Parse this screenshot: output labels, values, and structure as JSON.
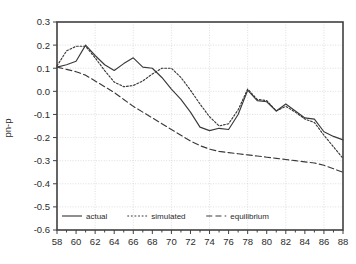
{
  "chart_data": {
    "type": "line",
    "title": "",
    "subtitle": "",
    "xlabel": "",
    "ylabel": "pn-p",
    "xlim": [
      58,
      88
    ],
    "ylim": [
      -0.6,
      0.3
    ],
    "grid": true,
    "legend_position": "bottom-left-inside",
    "xticks": [
      58,
      60,
      62,
      64,
      66,
      68,
      70,
      72,
      74,
      76,
      78,
      80,
      82,
      84,
      86,
      88
    ],
    "xtick_labels": [
      "58",
      "60",
      "62",
      "64",
      "66",
      "68",
      "70",
      "72",
      "74",
      "76",
      "78",
      "80",
      "82",
      "84",
      "86",
      "88"
    ],
    "yticks": [
      0.3,
      0.2,
      0.1,
      0.0,
      -0.1,
      -0.2,
      -0.3,
      -0.4,
      -0.5,
      -0.6
    ],
    "ytick_labels": [
      "0.3",
      "0.2",
      "0.1",
      "0.0",
      "-0.1",
      "-0.2",
      "-0.3",
      "-0.4",
      "-0.5",
      "-0.6"
    ],
    "x": [
      58,
      59,
      60,
      61,
      62,
      63,
      64,
      65,
      66,
      67,
      68,
      69,
      70,
      71,
      72,
      73,
      74,
      75,
      76,
      77,
      78,
      79,
      80,
      81,
      82,
      83,
      84,
      85,
      86,
      87,
      88
    ],
    "series": [
      {
        "name": "actual",
        "style": "solid",
        "color": "#3a3a3a",
        "values": [
          0.105,
          0.115,
          0.13,
          0.2,
          0.155,
          0.115,
          0.09,
          0.12,
          0.145,
          0.105,
          0.1,
          0.06,
          0.01,
          -0.035,
          -0.09,
          -0.155,
          -0.17,
          -0.16,
          -0.165,
          -0.1,
          0.005,
          -0.04,
          -0.045,
          -0.085,
          -0.055,
          -0.085,
          -0.115,
          -0.12,
          -0.175,
          -0.195,
          -0.21
        ]
      },
      {
        "name": "simulated",
        "style": "dotted",
        "color": "#3a3a3a",
        "values": [
          0.11,
          0.175,
          0.195,
          0.195,
          0.145,
          0.09,
          0.04,
          0.02,
          0.025,
          0.045,
          0.075,
          0.1,
          0.1,
          0.06,
          0.005,
          -0.055,
          -0.11,
          -0.15,
          -0.14,
          -0.08,
          0.01,
          -0.035,
          -0.04,
          -0.085,
          -0.065,
          -0.09,
          -0.12,
          -0.135,
          -0.19,
          -0.24,
          -0.29
        ]
      },
      {
        "name": "equilibrium",
        "style": "dashed",
        "color": "#3a3a3a",
        "values": [
          0.105,
          0.095,
          0.085,
          0.07,
          0.045,
          0.02,
          -0.005,
          -0.035,
          -0.065,
          -0.09,
          -0.115,
          -0.14,
          -0.165,
          -0.19,
          -0.215,
          -0.235,
          -0.25,
          -0.26,
          -0.265,
          -0.27,
          -0.275,
          -0.28,
          -0.285,
          -0.29,
          -0.295,
          -0.3,
          -0.305,
          -0.31,
          -0.32,
          -0.335,
          -0.35
        ]
      }
    ],
    "plot_series_pixel_paths": {
      "actual": "M 57,83 L 66.5,80 L 76,73 L 85.5,44 L 95,63 L 104.5,82 L 114,92 L 123.5,77 L 133,65 L 142.5,84 L 152,86 L 161.5,104 L 171,129 L 180.5,151 L 190,178 L 199.5,183 L 209,41 L 218.5,114 L 228,151 L 237.5,151 L 247,41 L 256.5,123 L 266,76 L 275.5,106 L 285,95 L 294.5,115 L 304,91 L 313.5,110 L 323,172 L 332.5,213 L 342,225",
      "simulated": "M 57,81 L 66.5,49 L 76,41 L 85.5,41 L 95,66 L 104.5,92 L 114,116 L 123.5,126 L 133,124 L 142.5,114 L 152,99 L 161.5,87 L 171,87 L 180.5,107 L 190,134 L 199.5,164 L 209,55 L 218.5,70 L 228,36 L 237.5,44 L 247,64 L 256.5,89 L 266,79 L 275.5,105 L 285,97 L 294.5,113 L 304,103 L 313.5,120 L 323,168 L 332.5,181 L 342,183",
      "equilibrium": "M 57,83 L 66.5,88 L 76,93 L 85.5,100 L 95,112 L 104.5,124 L 114,137 L 123.5,151 L 133,166 L 142.5,178 L 152,190 L 161.5,203 L 171,215 L 180.5,200 L 190,186 L 199.5,175 L 209,155 L 218.5,168 L 228,150 L 237.5,142 L 247,140 L 256.5,146 L 266,152 L 275.5,158 L 285,164 L 294.5,171 L 304,182 L 313.5,188 L 323,191 L 332.5,196 L 342,198"
    }
  },
  "legend": {
    "items": [
      {
        "label": "actual",
        "style": "solid"
      },
      {
        "label": "simulated",
        "style": "dotted"
      },
      {
        "label": "equilibrium",
        "style": "dashed"
      }
    ]
  },
  "colors": {
    "line": "#3a3a3a",
    "frame": "#404040",
    "grid": "#c8c8c8",
    "text": "#2b2b2b",
    "background": "#ffffff"
  }
}
